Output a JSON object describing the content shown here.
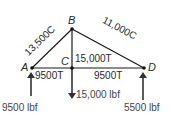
{
  "diagram": {
    "type": "truss-free-body",
    "nodes": [
      {
        "id": "A",
        "label": "A"
      },
      {
        "id": "B",
        "label": "B"
      },
      {
        "id": "C",
        "label": "C"
      },
      {
        "id": "D",
        "label": "D"
      }
    ],
    "members": [
      {
        "from": "A",
        "to": "B",
        "label": "13,500C"
      },
      {
        "from": "B",
        "to": "D",
        "label": "11,000C"
      },
      {
        "from": "B",
        "to": "C",
        "label": "15,000T"
      },
      {
        "from": "A",
        "to": "C",
        "label": "9500T"
      },
      {
        "from": "C",
        "to": "D",
        "label": "9500T"
      }
    ],
    "forces": [
      {
        "at": "A",
        "direction": "up",
        "label": "9500 lbf"
      },
      {
        "at": "C",
        "direction": "down",
        "label": "15,000 lbf"
      },
      {
        "at": "D",
        "direction": "up",
        "label": "5500 lbf"
      }
    ],
    "colors": {
      "line": "#1a1a1a",
      "text": "#2a2a2a",
      "background": "#ffffff"
    }
  }
}
